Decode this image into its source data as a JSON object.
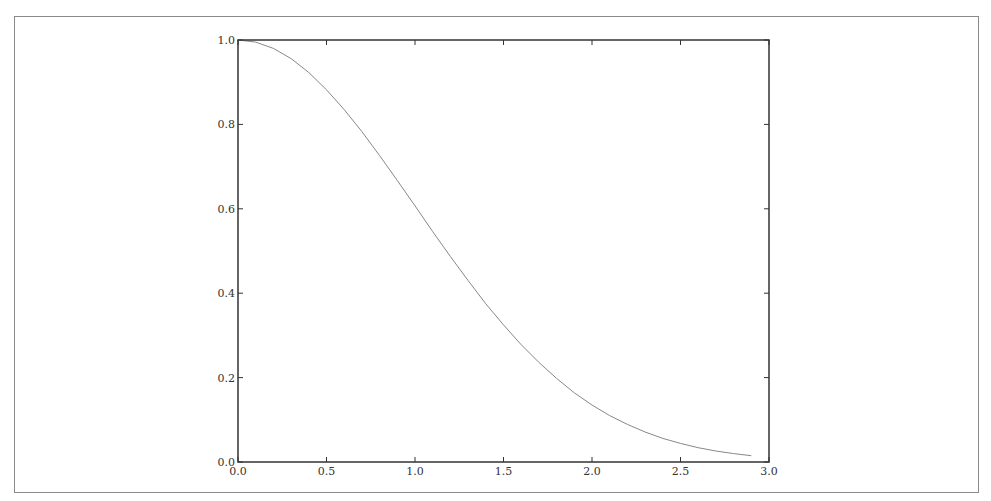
{
  "chart_data": {
    "type": "line",
    "title": "",
    "xlabel": "",
    "ylabel": "",
    "xlim": [
      0.0,
      3.0
    ],
    "ylim": [
      0.0,
      1.0
    ],
    "grid": false,
    "legend": null,
    "x_ticks": [
      "0.0",
      "0.5",
      "1.0",
      "1.5",
      "2.0",
      "2.5",
      "3.0"
    ],
    "y_ticks": [
      "0.0",
      "0.2",
      "0.4",
      "0.6",
      "0.8",
      "1.0"
    ],
    "series": [
      {
        "name": "curve",
        "color": "#888888",
        "x": [
          0.0,
          0.1,
          0.2,
          0.3,
          0.4,
          0.5,
          0.6,
          0.7,
          0.8,
          0.9,
          1.0,
          1.1,
          1.2,
          1.3,
          1.4,
          1.5,
          1.6,
          1.7,
          1.8,
          1.9,
          2.0,
          2.1,
          2.2,
          2.3,
          2.4,
          2.5,
          2.6,
          2.7,
          2.8,
          2.9
        ],
        "y": [
          1.0,
          0.995,
          0.98,
          0.956,
          0.923,
          0.882,
          0.835,
          0.783,
          0.726,
          0.667,
          0.607,
          0.546,
          0.487,
          0.43,
          0.375,
          0.325,
          0.278,
          0.236,
          0.198,
          0.164,
          0.135,
          0.11,
          0.089,
          0.071,
          0.056,
          0.044,
          0.034,
          0.026,
          0.02,
          0.015
        ]
      }
    ]
  },
  "colors": {
    "axes": "#333333",
    "line": "#888888",
    "frame": "#8a8a8a",
    "background": "#ffffff"
  }
}
